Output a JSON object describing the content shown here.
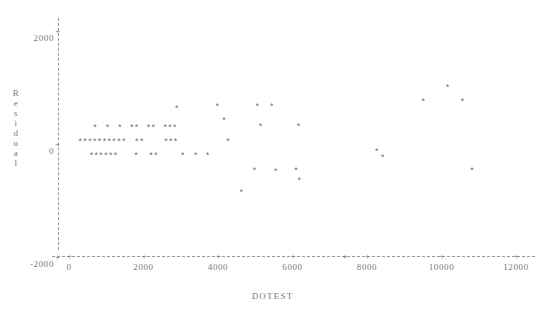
{
  "chart_data": {
    "type": "scatter",
    "title": "",
    "xlabel": "DOTEST",
    "ylabel": "Residual",
    "xlim": [
      -200,
      12400
    ],
    "ylim": [
      -2400,
      2300
    ],
    "xticks": [
      0,
      2000,
      4000,
      6000,
      8000,
      10000,
      12000
    ],
    "xtick_labels": [
      "0",
      "2000",
      "4000",
      "6000",
      "8000",
      "10000",
      "12000"
    ],
    "yticks": [
      2000,
      0,
      -2000
    ],
    "ytick_labels": [
      "2000",
      "0",
      "-2000"
    ],
    "grid": false,
    "legend": null,
    "marker": "*",
    "marker_color": "#6f6f7a",
    "axis_color": "#9a9a9a",
    "points": [
      {
        "x": 300,
        "y": 0
      },
      {
        "x": 430,
        "y": 0
      },
      {
        "x": 560,
        "y": 0
      },
      {
        "x": 690,
        "y": 0
      },
      {
        "x": 820,
        "y": 0
      },
      {
        "x": 950,
        "y": 0
      },
      {
        "x": 1080,
        "y": 0
      },
      {
        "x": 1210,
        "y": 0
      },
      {
        "x": 1340,
        "y": 0
      },
      {
        "x": 1470,
        "y": 0
      },
      {
        "x": 1820,
        "y": 0
      },
      {
        "x": 1950,
        "y": 0
      },
      {
        "x": 2600,
        "y": 0
      },
      {
        "x": 2730,
        "y": 0
      },
      {
        "x": 2860,
        "y": 0
      },
      {
        "x": 4270,
        "y": 0
      },
      {
        "x": 700,
        "y": 250
      },
      {
        "x": 1030,
        "y": 250
      },
      {
        "x": 1360,
        "y": 250
      },
      {
        "x": 1680,
        "y": 250
      },
      {
        "x": 1810,
        "y": 250
      },
      {
        "x": 2130,
        "y": 250
      },
      {
        "x": 2260,
        "y": 250
      },
      {
        "x": 2580,
        "y": 250
      },
      {
        "x": 2710,
        "y": 250
      },
      {
        "x": 2840,
        "y": 250
      },
      {
        "x": 600,
        "y": -250
      },
      {
        "x": 730,
        "y": -250
      },
      {
        "x": 860,
        "y": -250
      },
      {
        "x": 990,
        "y": -250
      },
      {
        "x": 1120,
        "y": -250
      },
      {
        "x": 1250,
        "y": -250
      },
      {
        "x": 1800,
        "y": -250
      },
      {
        "x": 2200,
        "y": -250
      },
      {
        "x": 2330,
        "y": -250
      },
      {
        "x": 3050,
        "y": -250
      },
      {
        "x": 3400,
        "y": -250
      },
      {
        "x": 3720,
        "y": -250
      },
      {
        "x": 2890,
        "y": 590
      },
      {
        "x": 3980,
        "y": 620
      },
      {
        "x": 4160,
        "y": 380
      },
      {
        "x": 5050,
        "y": 620
      },
      {
        "x": 5440,
        "y": 620
      },
      {
        "x": 5140,
        "y": 270
      },
      {
        "x": 6160,
        "y": 270
      },
      {
        "x": 4980,
        "y": -520
      },
      {
        "x": 5550,
        "y": -530
      },
      {
        "x": 6090,
        "y": -520
      },
      {
        "x": 6180,
        "y": -690
      },
      {
        "x": 4620,
        "y": -900
      },
      {
        "x": 7410,
        "y": -2070
      },
      {
        "x": 8420,
        "y": -280
      },
      {
        "x": 8260,
        "y": -180
      },
      {
        "x": 9510,
        "y": 700
      },
      {
        "x": 10160,
        "y": 950
      },
      {
        "x": 10560,
        "y": 700
      },
      {
        "x": 10820,
        "y": -520
      }
    ]
  },
  "axis": {
    "y_title_chars": [
      "R",
      "e",
      "s",
      "i",
      "d",
      "u",
      "a",
      "l"
    ],
    "x_title": "DOTEST",
    "tick_marker": "+"
  }
}
